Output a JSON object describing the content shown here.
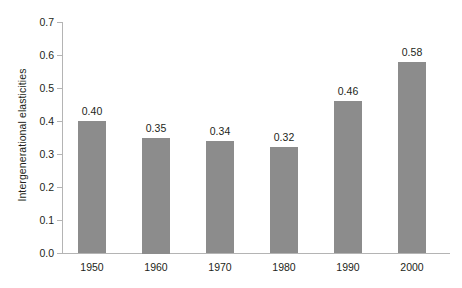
{
  "chart_data": {
    "type": "bar",
    "title": "",
    "subtitle": "",
    "xlabel": "",
    "ylabel": "Intergenerational elasticities",
    "categories": [
      "1950",
      "1960",
      "1970",
      "1980",
      "1990",
      "2000"
    ],
    "values": [
      0.4,
      0.35,
      0.34,
      0.32,
      0.46,
      0.58
    ],
    "data_labels": [
      "0.40",
      "0.35",
      "0.34",
      "0.32",
      "0.46",
      "0.58"
    ],
    "ylim": [
      0.0,
      0.7
    ],
    "ytick_step": 0.1,
    "ytick_labels": [
      "0.0",
      "0.1",
      "0.2",
      "0.3",
      "0.4",
      "0.5",
      "0.6",
      "0.7"
    ],
    "ytick_values": [
      0.0,
      0.1,
      0.2,
      0.3,
      0.4,
      0.5,
      0.6,
      0.7
    ],
    "grid": false,
    "legend": null,
    "legend_position": "none",
    "series": [
      {
        "name": "Intergenerational elasticities",
        "values": [
          0.4,
          0.35,
          0.34,
          0.32,
          0.46,
          0.58
        ]
      }
    ]
  },
  "colors": {
    "bar_fill": "#8c8c8c",
    "axis_line": "#b4b4b4",
    "text": "#231f20",
    "background": "#ffffff"
  }
}
